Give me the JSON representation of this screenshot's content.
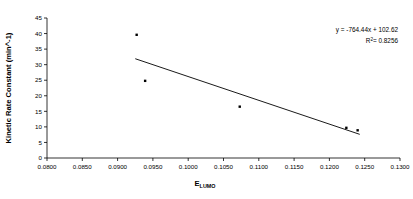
{
  "chart_data": {
    "type": "scatter",
    "title": "",
    "xlabel": "E_LUMO",
    "xlabel_base": "E",
    "xlabel_sub": "LUMO",
    "ylabel": "Kinetic Rate Constant (min^-1)",
    "xlim": [
      0.08,
      0.13
    ],
    "ylim": [
      0,
      45
    ],
    "xticks": [
      "0.0800",
      "0.0850",
      "0.0900",
      "0.0950",
      "0.1000",
      "0.1050",
      "0.1100",
      "0.1150",
      "0.1200",
      "0.1250",
      "0.1300"
    ],
    "xtick_values": [
      0.08,
      0.085,
      0.09,
      0.095,
      0.1,
      0.105,
      0.11,
      0.115,
      0.12,
      0.125,
      0.13
    ],
    "yticks": [
      "0",
      "5",
      "10",
      "15",
      "20",
      "25",
      "30",
      "35",
      "40",
      "45"
    ],
    "ytick_values": [
      0,
      5,
      10,
      15,
      20,
      25,
      30,
      35,
      40,
      45
    ],
    "grid": false,
    "legend": false,
    "marker": "filled-square",
    "marker_color": "#000000",
    "line_color": "#000000",
    "points": [
      {
        "x": 0.0927,
        "y": 39.6
      },
      {
        "x": 0.0939,
        "y": 24.8
      },
      {
        "x": 0.1073,
        "y": 16.5
      },
      {
        "x": 0.1224,
        "y": 9.7
      },
      {
        "x": 0.124,
        "y": 8.9
      }
    ],
    "trendline": {
      "slope": -764.44,
      "intercept": 102.62,
      "x_start": 0.0925,
      "x_end": 0.1243,
      "equation": "y = -764.44x + 102.62",
      "r_squared_label": "R",
      "r_squared_exponent": "2",
      "r_squared_value": "= 0.8256"
    }
  },
  "annotations": {
    "equation": "y = -764.44x + 102.62",
    "r2_base": "R",
    "r2_exp": "2",
    "r2_rest": "= 0.8256"
  }
}
